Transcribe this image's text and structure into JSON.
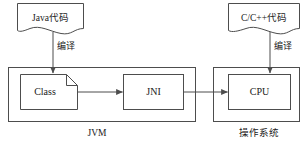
{
  "diagram": {
    "stroke_color": "#4d4d4d",
    "text_color": "#1a1a1a",
    "background_color": "#ffffff",
    "nodes": {
      "java_source": {
        "label": "Java代码",
        "shape": "document"
      },
      "cpp_source": {
        "label": "C/C++代码",
        "shape": "document"
      },
      "class_file": {
        "label": "Class",
        "shape": "folded-corner-document"
      },
      "jni": {
        "label": "JNI",
        "shape": "rectangle"
      },
      "cpu": {
        "label": "CPU",
        "shape": "rectangle"
      },
      "jvm_container": {
        "label": "JVM",
        "shape": "rectangle-container"
      },
      "os_container": {
        "label": "操作系统",
        "shape": "rectangle-container"
      }
    },
    "edges": [
      {
        "id": "java-to-class",
        "label": "编译",
        "from": "java_source",
        "to": "class_file",
        "direction": "down"
      },
      {
        "id": "cpp-to-cpu",
        "label": "编译",
        "from": "cpp_source",
        "to": "cpu",
        "direction": "down"
      },
      {
        "id": "class-to-jni",
        "label": "",
        "from": "class_file",
        "to": "jni",
        "direction": "right"
      },
      {
        "id": "jni-to-cpu",
        "label": "",
        "from": "jni",
        "to": "cpu",
        "direction": "right"
      }
    ]
  }
}
